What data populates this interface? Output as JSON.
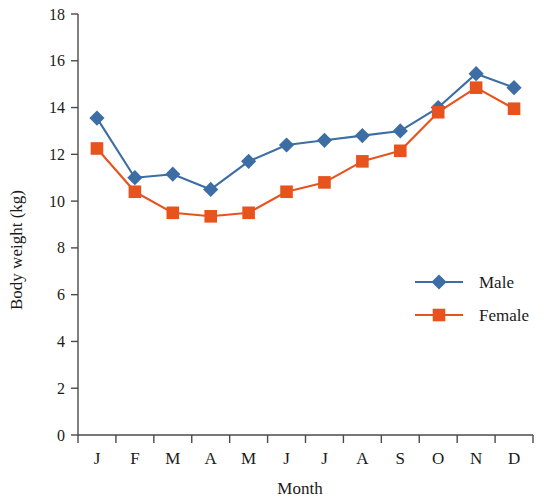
{
  "chart_data": {
    "type": "line",
    "title": "",
    "xlabel": "Month",
    "ylabel": "Body weight (kg)",
    "categories": [
      "J",
      "F",
      "M",
      "A",
      "M",
      "J",
      "J",
      "A",
      "S",
      "O",
      "N",
      "D"
    ],
    "xtick_labels": [
      "J",
      "F",
      "M",
      "A",
      "M",
      "J",
      "J",
      "A",
      "S",
      "O",
      "N",
      "D"
    ],
    "ytick_labels": [
      "0",
      "2",
      "4",
      "6",
      "8",
      "10",
      "12",
      "14",
      "16",
      "18"
    ],
    "yticks": [
      0,
      2,
      4,
      6,
      8,
      10,
      12,
      14,
      16,
      18
    ],
    "ylim": [
      0,
      18
    ],
    "grid": false,
    "legend_position": "center-right",
    "series": [
      {
        "name": "Male",
        "color": "#3c6ea5",
        "marker": "diamond",
        "values": [
          13.55,
          11.0,
          11.15,
          10.5,
          11.7,
          12.4,
          12.6,
          12.8,
          13.0,
          14.0,
          15.45,
          14.85
        ]
      },
      {
        "name": "Female",
        "color": "#e8531d",
        "marker": "square",
        "values": [
          12.25,
          10.4,
          9.5,
          9.35,
          9.5,
          10.4,
          10.8,
          11.7,
          12.15,
          13.8,
          14.85,
          13.95
        ]
      }
    ]
  },
  "legend": {
    "entries": [
      {
        "label": "Male"
      },
      {
        "label": "Female"
      }
    ]
  },
  "axes": {
    "x_title": "Month",
    "y_title": "Body weight (kg)"
  },
  "colors": {
    "male": "#3c6ea5",
    "female": "#e8531d",
    "axis": "#4a4a4a",
    "text": "#1a1a1a"
  }
}
